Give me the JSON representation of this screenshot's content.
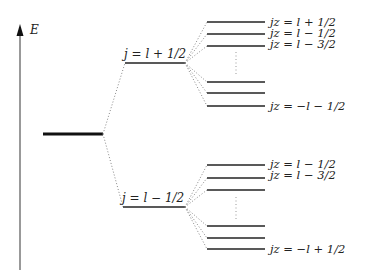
{
  "axis": {
    "label": "E",
    "color": "#222222"
  },
  "base_level": {
    "label": ""
  },
  "j_levels": [
    {
      "label": "j = l + 1/2"
    },
    {
      "label": "j = l − 1/2"
    }
  ],
  "upper_sublevels": {
    "labels": [
      "jz = l + 1/2",
      "jz = l − 1/2",
      "jz = l − 3/2",
      "jz = −l − 1/2"
    ]
  },
  "lower_sublevels": {
    "labels": [
      "jz = l − 1/2",
      "jz = l − 3/2",
      "jz = −l + 1/2"
    ]
  }
}
